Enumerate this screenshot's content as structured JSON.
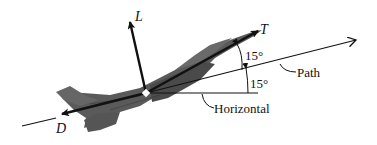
{
  "diagram": {
    "title": "",
    "forces": {
      "lift": "L",
      "thrust": "T",
      "drag": "D"
    },
    "lines": {
      "path": "Path",
      "horizontal": "Horizontal"
    },
    "angles": {
      "thrust_to_path": "15°",
      "path_to_horizontal": "15°"
    },
    "colors": {
      "ink": "#111111",
      "aircraft_fill": "#5a5a5a",
      "aircraft_dark": "#3a3a3a"
    }
  }
}
